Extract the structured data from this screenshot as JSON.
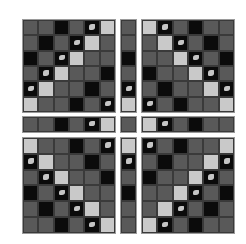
{
  "figure": {
    "legend": {
      "G": "gray cell",
      "D": "dark cell",
      "L": "light cell",
      "S": "dark cell with light object fragment"
    },
    "colors": {
      "gray": "#595959",
      "dark": "#0b0b0b",
      "light": "#c9c9c9",
      "separator": "#ffffff"
    },
    "blocks": {
      "top_left": [
        [
          "G",
          "G",
          "D",
          "G",
          "S",
          "L"
        ],
        [
          "G",
          "D",
          "G",
          "S",
          "L",
          "G"
        ],
        [
          "D",
          "G",
          "S",
          "L",
          "G",
          "G"
        ],
        [
          "G",
          "S",
          "L",
          "G",
          "G",
          "D"
        ],
        [
          "S",
          "L",
          "G",
          "G",
          "D",
          "G"
        ],
        [
          "L",
          "G",
          "G",
          "D",
          "G",
          "S"
        ]
      ],
      "top_middle": [
        "G",
        "G",
        "D",
        "G",
        "S",
        "L"
      ],
      "top_right": [
        [
          "L",
          "S",
          "G",
          "D",
          "G",
          "G"
        ],
        [
          "G",
          "L",
          "S",
          "G",
          "D",
          "G"
        ],
        [
          "G",
          "G",
          "L",
          "S",
          "G",
          "D"
        ],
        [
          "D",
          "G",
          "G",
          "L",
          "S",
          "G"
        ],
        [
          "G",
          "D",
          "G",
          "G",
          "L",
          "S"
        ],
        [
          "S",
          "G",
          "D",
          "G",
          "G",
          "L"
        ]
      ],
      "middle_left": [
        "G",
        "G",
        "D",
        "G",
        "S",
        "L"
      ],
      "middle_middle": [
        "G"
      ],
      "middle_right": [
        "L",
        "S",
        "G",
        "D",
        "G",
        "G"
      ],
      "bottom_left": [
        [
          "L",
          "G",
          "G",
          "D",
          "G",
          "S"
        ],
        [
          "S",
          "L",
          "G",
          "G",
          "D",
          "G"
        ],
        [
          "G",
          "S",
          "L",
          "G",
          "G",
          "D"
        ],
        [
          "D",
          "G",
          "S",
          "L",
          "G",
          "G"
        ],
        [
          "G",
          "D",
          "G",
          "S",
          "L",
          "G"
        ],
        [
          "G",
          "G",
          "D",
          "G",
          "S",
          "L"
        ]
      ],
      "bottom_middle": [
        "L",
        "S",
        "G",
        "D",
        "G",
        "G"
      ],
      "bottom_right": [
        [
          "S",
          "G",
          "D",
          "G",
          "G",
          "L"
        ],
        [
          "G",
          "D",
          "G",
          "G",
          "L",
          "S"
        ],
        [
          "D",
          "G",
          "G",
          "L",
          "S",
          "G"
        ],
        [
          "G",
          "G",
          "L",
          "S",
          "G",
          "D"
        ],
        [
          "G",
          "L",
          "S",
          "G",
          "D",
          "G"
        ],
        [
          "L",
          "S",
          "G",
          "D",
          "G",
          "G"
        ]
      ]
    }
  }
}
